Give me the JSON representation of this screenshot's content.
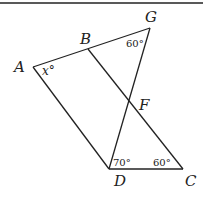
{
  "diagram": {
    "points": {
      "A": {
        "label": "A",
        "x": 33,
        "y": 67
      },
      "B": {
        "label": "B",
        "x": 88,
        "y": 49
      },
      "G": {
        "label": "G",
        "x": 150,
        "y": 28
      },
      "F": {
        "label": "F",
        "x": 129,
        "y": 100
      },
      "D": {
        "label": "D",
        "x": 109,
        "y": 169
      },
      "C": {
        "label": "C",
        "x": 183,
        "y": 169
      }
    },
    "segments": [
      "AG",
      "AD",
      "BC",
      "GD",
      "DC"
    ],
    "angles": {
      "A": "x°",
      "G": "60°",
      "D": "70°",
      "C": "60°"
    }
  }
}
